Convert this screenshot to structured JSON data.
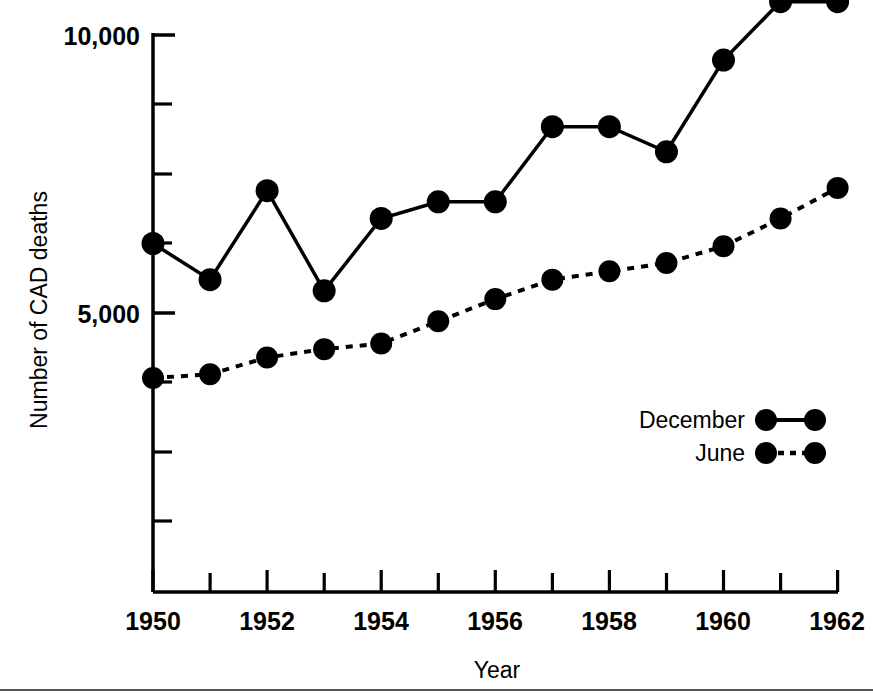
{
  "chart_data": {
    "type": "line",
    "title": "",
    "xlabel": "Year",
    "ylabel": "Number of CAD deaths",
    "x": [
      1950,
      1951,
      1952,
      1953,
      1954,
      1955,
      1956,
      1957,
      1958,
      1959,
      1960,
      1961,
      1962
    ],
    "xlim": [
      1950,
      1962
    ],
    "ylim": [
      0,
      10800
    ],
    "grid": false,
    "legend_position": "inside-right",
    "y_tick_labels": [
      "10,000",
      "5,000"
    ],
    "y_tick_values": [
      10000,
      5000
    ],
    "y_minor_tick_values": [
      8750,
      7500,
      6250,
      3750,
      2500,
      1250
    ],
    "x_tick_labels": [
      "1950",
      "",
      "1952",
      "",
      "1954",
      "",
      "1956",
      "",
      "1958",
      "",
      "1960",
      "",
      "1962"
    ],
    "series": [
      {
        "name": "December",
        "linestyle": "solid",
        "marker": "circle",
        "color": "#000000",
        "values": [
          6250,
          5600,
          7200,
          5400,
          6700,
          7000,
          7000,
          8350,
          8350,
          7900,
          9550,
          10600,
          10600
        ]
      },
      {
        "name": "June",
        "linestyle": "dotted",
        "marker": "circle",
        "color": "#000000",
        "values": [
          3830,
          3900,
          4200,
          4350,
          4450,
          4850,
          5250,
          5600,
          5750,
          5900,
          6200,
          6700,
          7250
        ]
      }
    ]
  },
  "axis": {
    "y_label": "Number of CAD deaths",
    "x_label": "Year",
    "y_labels": [
      "10,000",
      "5,000"
    ],
    "x_labels": [
      "1950",
      "1952",
      "1954",
      "1956",
      "1958",
      "1960",
      "1962"
    ]
  },
  "legend": {
    "items": [
      {
        "label": "December",
        "style": "solid"
      },
      {
        "label": "June",
        "style": "dotted"
      }
    ]
  },
  "colors": {
    "ink": "#000000",
    "rule": "#555555",
    "background": "#ffffff"
  }
}
